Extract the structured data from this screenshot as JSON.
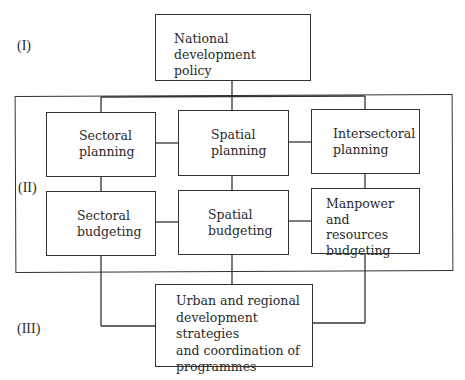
{
  "levels": {
    "I": "(I)",
    "II": "(II)",
    "III": "(III)"
  },
  "top": {
    "label": "National development\npolicy"
  },
  "planning_row": [
    {
      "label": "Sectoral\nplanning"
    },
    {
      "label": "Spatial\nplanning"
    },
    {
      "label": "Intersectoral\nplanning"
    }
  ],
  "budgeting_row": [
    {
      "label": "Sectoral\nbudgeting"
    },
    {
      "label": "Spatial\nbudgeting"
    },
    {
      "label": "Manpower and\nresources\nbudgeting"
    }
  ],
  "bottom": {
    "label": "Urban and regional\ndevelopment strategies\nand coordination of\nprogrammes"
  },
  "colors": {
    "line": "#333333",
    "background": "#ffffff"
  }
}
